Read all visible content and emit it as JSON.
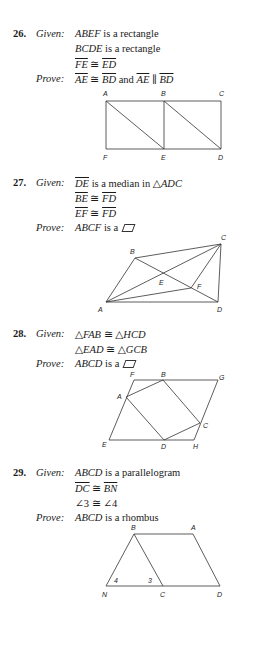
{
  "problems": [
    {
      "number": "26.",
      "given_label": "Given:",
      "prove_label": "Prove:",
      "given": [
        {
          "parts": [
            {
              "t": "ABEF",
              "s": "it"
            },
            {
              "t": " is a rectangle"
            }
          ]
        },
        {
          "parts": [
            {
              "t": "BCDE",
              "s": "it"
            },
            {
              "t": " is a rectangle"
            }
          ]
        },
        {
          "parts": [
            {
              "t": "FE",
              "s": "ov"
            },
            {
              "t": " ≅ "
            },
            {
              "t": "ED",
              "s": "ov"
            }
          ]
        }
      ],
      "prove": {
        "parts": [
          {
            "t": "AE",
            "s": "ov"
          },
          {
            "t": " ≅ "
          },
          {
            "t": "BD",
            "s": "ov"
          },
          {
            "t": " and "
          },
          {
            "t": "AE",
            "s": "ov"
          },
          {
            "t": " ∥ "
          },
          {
            "t": "BD",
            "s": "ov"
          }
        ]
      },
      "figure": {
        "points": {
          "A": [
            106,
            101
          ],
          "B": [
            164,
            101
          ],
          "C": [
            221,
            101
          ],
          "F": [
            106,
            149
          ],
          "E": [
            164,
            149
          ],
          "D": [
            221,
            149
          ]
        },
        "segments": [
          [
            "A",
            "C"
          ],
          [
            "F",
            "D"
          ],
          [
            "A",
            "F"
          ],
          [
            "B",
            "E"
          ],
          [
            "C",
            "D"
          ],
          [
            "A",
            "E"
          ],
          [
            "B",
            "D"
          ]
        ],
        "labels": [
          {
            "text": "A",
            "x": 103,
            "y": 96
          },
          {
            "text": "B",
            "x": 161,
            "y": 96
          },
          {
            "text": "C",
            "x": 219,
            "y": 96
          },
          {
            "text": "F",
            "x": 103,
            "y": 160
          },
          {
            "text": "E",
            "x": 161,
            "y": 160
          },
          {
            "text": "D",
            "x": 218,
            "y": 160
          }
        ]
      }
    },
    {
      "number": "27.",
      "given_label": "Given:",
      "prove_label": "Prove:",
      "given": [
        {
          "parts": [
            {
              "t": "DE",
              "s": "ov"
            },
            {
              "t": " is a median in △"
            },
            {
              "t": "ADC",
              "s": "it"
            }
          ]
        },
        {
          "parts": [
            {
              "t": "BE",
              "s": "ov"
            },
            {
              "t": " ≅ "
            },
            {
              "t": "FD",
              "s": "ov"
            }
          ]
        },
        {
          "parts": [
            {
              "t": "EF",
              "s": "ov"
            },
            {
              "t": " ≅ "
            },
            {
              "t": "FD",
              "s": "ov"
            }
          ]
        }
      ],
      "prove": {
        "parts": [
          {
            "t": "ABCF",
            "s": "it"
          },
          {
            "t": " is a "
          }
        ],
        "symbol": "parallelogram"
      },
      "figure": {
        "points": {
          "A": [
            106,
            302
          ],
          "B": [
            135,
            258
          ],
          "C": [
            221,
            244
          ],
          "D": [
            218,
            302
          ],
          "E": [
            164,
            276
          ],
          "F": [
            191,
            288
          ]
        },
        "segments": [
          [
            "A",
            "B"
          ],
          [
            "B",
            "C"
          ],
          [
            "C",
            "D"
          ],
          [
            "A",
            "D"
          ],
          [
            "A",
            "C"
          ],
          [
            "B",
            "D"
          ],
          [
            "A",
            "F"
          ],
          [
            "C",
            "F"
          ]
        ],
        "labels": [
          {
            "text": "B",
            "x": 130,
            "y": 254
          },
          {
            "text": "C",
            "x": 221,
            "y": 240
          },
          {
            "text": "E",
            "x": 159,
            "y": 285
          },
          {
            "text": "F",
            "x": 197,
            "y": 289
          },
          {
            "text": "A",
            "x": 98,
            "y": 312
          },
          {
            "text": "D",
            "x": 217,
            "y": 312
          }
        ]
      }
    },
    {
      "number": "28.",
      "given_label": "Given:",
      "prove_label": "Prove:",
      "given": [
        {
          "parts": [
            {
              "t": "△"
            },
            {
              "t": "FAB",
              "s": "it"
            },
            {
              "t": " ≅ △"
            },
            {
              "t": "HCD",
              "s": "it"
            }
          ]
        },
        {
          "parts": [
            {
              "t": "△"
            },
            {
              "t": "EAD",
              "s": "it"
            },
            {
              "t": " ≅ △"
            },
            {
              "t": "GCB",
              "s": "it"
            }
          ]
        }
      ],
      "prove": {
        "parts": [
          {
            "t": "ABCD",
            "s": "it"
          },
          {
            "t": " is a "
          }
        ],
        "symbol": "parallelogram"
      },
      "figure": {
        "points": {
          "F": [
            134,
            380
          ],
          "B": [
            163,
            380
          ],
          "G": [
            218,
            380
          ],
          "A": [
            126,
            397
          ],
          "C": [
            200,
            423
          ],
          "E": [
            109,
            440
          ],
          "D": [
            164,
            440
          ],
          "H": [
            194,
            440
          ]
        },
        "segments": [
          [
            "F",
            "G"
          ],
          [
            "E",
            "H"
          ],
          [
            "F",
            "E"
          ],
          [
            "G",
            "H"
          ],
          [
            "A",
            "B"
          ],
          [
            "B",
            "C"
          ],
          [
            "C",
            "D"
          ],
          [
            "D",
            "A"
          ]
        ],
        "labels": [
          {
            "text": "F",
            "x": 130,
            "y": 377
          },
          {
            "text": "B",
            "x": 161,
            "y": 377
          },
          {
            "text": "G",
            "x": 219,
            "y": 380
          },
          {
            "text": "A",
            "x": 117,
            "y": 399
          },
          {
            "text": "C",
            "x": 203,
            "y": 428
          },
          {
            "text": "E",
            "x": 102,
            "y": 447
          },
          {
            "text": "D",
            "x": 161,
            "y": 449
          },
          {
            "text": "H",
            "x": 193,
            "y": 449
          }
        ]
      }
    },
    {
      "number": "29.",
      "given_label": "Given:",
      "prove_label": "Prove:",
      "given": [
        {
          "parts": [
            {
              "t": "ABCD",
              "s": "it"
            },
            {
              "t": " is a parallelogram"
            }
          ]
        },
        {
          "parts": [
            {
              "t": "DC",
              "s": "ov"
            },
            {
              "t": " ≅ "
            },
            {
              "t": "BN",
              "s": "ov"
            }
          ]
        },
        {
          "parts": [
            {
              "t": "∠3 ≅ ∠4"
            }
          ]
        }
      ],
      "prove": {
        "parts": [
          {
            "t": "ABCD",
            "s": "it"
          },
          {
            "t": " is a rhombus"
          }
        ]
      },
      "figure": {
        "points": {
          "B": [
            134,
            534
          ],
          "A": [
            193,
            534
          ],
          "N": [
            106,
            586
          ],
          "C": [
            163,
            586
          ],
          "D": [
            220,
            586
          ]
        },
        "segments": [
          [
            "B",
            "A"
          ],
          [
            "N",
            "D"
          ],
          [
            "N",
            "B"
          ],
          [
            "B",
            "C"
          ],
          [
            "A",
            "D"
          ]
        ],
        "labels": [
          {
            "text": "B",
            "x": 131,
            "y": 530
          },
          {
            "text": "A",
            "x": 191,
            "y": 530
          },
          {
            "text": "N",
            "x": 102,
            "y": 597
          },
          {
            "text": "C",
            "x": 160,
            "y": 597
          },
          {
            "text": "D",
            "x": 217,
            "y": 597
          },
          {
            "text": "4",
            "x": 114,
            "y": 583
          },
          {
            "text": "3",
            "x": 148,
            "y": 583
          }
        ]
      }
    }
  ]
}
